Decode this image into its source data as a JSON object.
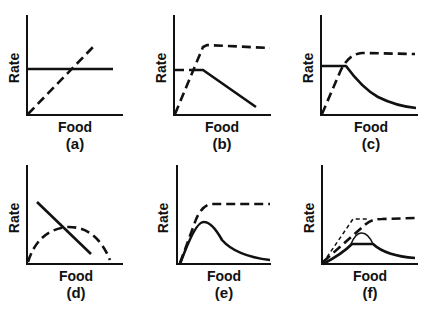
{
  "figure": {
    "x_axis_label": "Food",
    "y_axis_label": "Rate",
    "panels": [
      {
        "id": "a",
        "label": "(a)"
      },
      {
        "id": "b",
        "label": "(b)"
      },
      {
        "id": "c",
        "label": "(c)"
      },
      {
        "id": "d",
        "label": "(d)"
      },
      {
        "id": "e",
        "label": "(e)"
      },
      {
        "id": "f",
        "label": "(f)"
      }
    ],
    "colors": {
      "line": "#111111",
      "background": "#ffffff"
    }
  }
}
